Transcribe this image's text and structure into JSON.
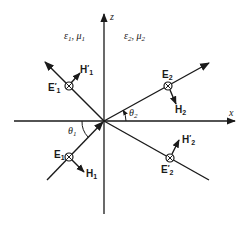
{
  "figure": {
    "axes": {
      "x_label": "x",
      "z_label": "z"
    },
    "media": {
      "medium1": {
        "eps": "ε",
        "mu": "μ",
        "index": "1",
        "text": "ε₁, μ₁"
      },
      "medium2": {
        "eps": "ε",
        "mu": "μ",
        "index": "2",
        "text": "ε₂, μ₂"
      }
    },
    "angles": {
      "theta1": {
        "symbol": "θ",
        "index": "1"
      },
      "theta2": {
        "symbol": "θ",
        "index": "2"
      }
    },
    "waves": {
      "incident": {
        "E": "E",
        "E_index": "1",
        "H": "H",
        "H_index": "1",
        "prime": ""
      },
      "reflected": {
        "E": "E",
        "E_index": "1",
        "H": "H",
        "H_index": "1",
        "prime": "′"
      },
      "transmitted": {
        "E": "E",
        "E_index": "2",
        "H": "H",
        "H_index": "2",
        "prime": ""
      },
      "transmitted_reflected": {
        "E": "E",
        "E_index": "2",
        "H": "H",
        "H_index": "2",
        "prime": "′"
      }
    },
    "colors": {
      "ink": "#1a1a1a",
      "background": "#ffffff"
    }
  }
}
